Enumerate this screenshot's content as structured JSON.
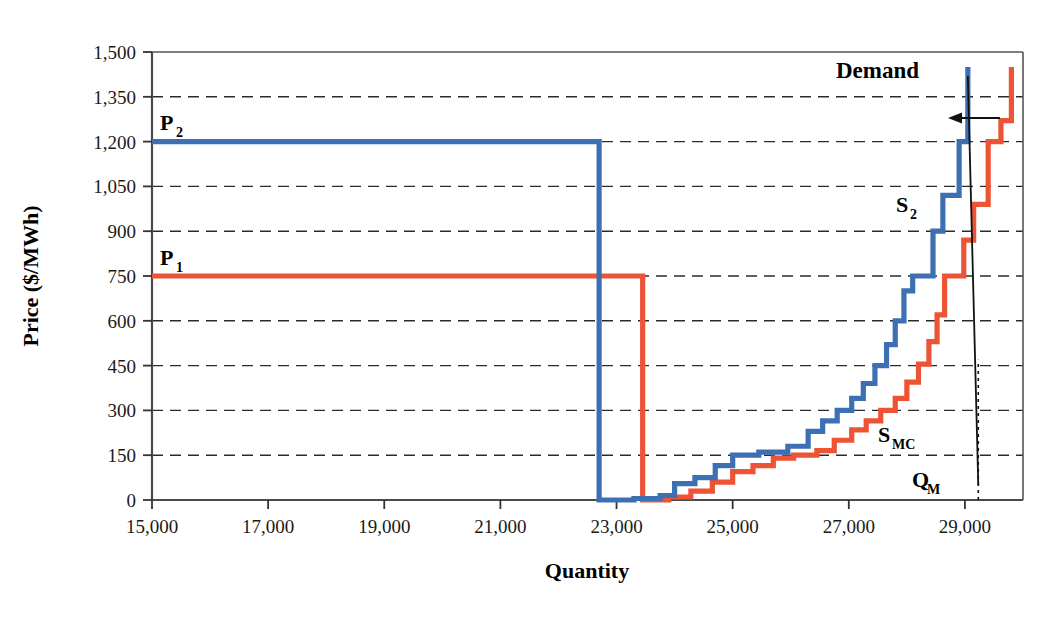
{
  "chart_data": {
    "type": "line",
    "title": "",
    "xlabel": "Quantity",
    "ylabel": "Price ($/MWh)",
    "xlim": [
      15000,
      30000
    ],
    "ylim": [
      0,
      1500
    ],
    "xticks": [
      "15,000",
      "17,000",
      "19,000",
      "21,000",
      "23,000",
      "25,000",
      "27,000",
      "29,000"
    ],
    "xtick_values": [
      15000,
      17000,
      19000,
      21000,
      23000,
      25000,
      27000,
      29000
    ],
    "yticks": [
      "0",
      "150",
      "300",
      "450",
      "600",
      "750",
      "900",
      "1,050",
      "1,200",
      "1,350",
      "1,500"
    ],
    "ytick_values": [
      0,
      150,
      300,
      450,
      600,
      750,
      900,
      1050,
      1200,
      1350,
      1500
    ],
    "grid": "horizontal-dashed",
    "legend": "inline-annotations",
    "colors": {
      "supply_s2": "#3d6fb3",
      "supply_smc": "#ed5335",
      "demand": "#000000",
      "grid": "#333333",
      "axis": "#4d4d4d"
    },
    "annotations": [
      {
        "name": "P2",
        "text": "P",
        "sub": "2",
        "x": 15300,
        "y": 1270,
        "note": "Price level of S2 offer curve plateau = 1200"
      },
      {
        "name": "P1",
        "text": "P",
        "sub": "1",
        "x": 15300,
        "y": 820,
        "note": "Price level of S_MC offer curve plateau = 750"
      },
      {
        "name": "Demand",
        "text": "Demand",
        "x": 28100,
        "y": 1455
      },
      {
        "name": "S2",
        "text": "S",
        "sub": "2",
        "x": 28000,
        "y": 985
      },
      {
        "name": "SMC",
        "text": "S",
        "sub": "MC",
        "x": 27900,
        "y": 215
      },
      {
        "name": "QM",
        "text": "Q",
        "sub": "M",
        "x": 28950,
        "y": 85
      },
      {
        "name": "shift-arrow",
        "text": "",
        "note": "leftward arrow from S_MC vertical segment to S2 vertical segment near P=1270"
      }
    ],
    "series": [
      {
        "name": "S_MC",
        "label": "S_MC",
        "color": "#ed5335",
        "description": "Marginal cost supply step curve; flat plateau at 750 from 15,000 to ~28,650 then steps upward sharply",
        "points": [
          [
            15000,
            750
          ],
          [
            23450,
            750
          ],
          [
            23450,
            0
          ],
          [
            23900,
            0
          ],
          [
            23900,
            10
          ],
          [
            24280,
            10
          ],
          [
            24280,
            30
          ],
          [
            24650,
            30
          ],
          [
            24650,
            60
          ],
          [
            25000,
            60
          ],
          [
            25000,
            95
          ],
          [
            25350,
            95
          ],
          [
            25350,
            115
          ],
          [
            25700,
            115
          ],
          [
            25700,
            140
          ],
          [
            26050,
            140
          ],
          [
            26050,
            150
          ],
          [
            26450,
            150
          ],
          [
            26450,
            165
          ],
          [
            26750,
            165
          ],
          [
            26750,
            200
          ],
          [
            27050,
            200
          ],
          [
            27050,
            235
          ],
          [
            27300,
            235
          ],
          [
            27300,
            265
          ],
          [
            27550,
            265
          ],
          [
            27550,
            300
          ],
          [
            27800,
            300
          ],
          [
            27800,
            340
          ],
          [
            28000,
            340
          ],
          [
            28000,
            395
          ],
          [
            28200,
            395
          ],
          [
            28200,
            455
          ],
          [
            28380,
            455
          ],
          [
            28380,
            530
          ],
          [
            28520,
            530
          ],
          [
            28520,
            620
          ],
          [
            28650,
            620
          ],
          [
            28650,
            750
          ],
          [
            28980,
            750
          ],
          [
            28980,
            870
          ],
          [
            29150,
            870
          ],
          [
            29150,
            990
          ],
          [
            29400,
            990
          ],
          [
            29400,
            1200
          ],
          [
            29620,
            1200
          ],
          [
            29620,
            1270
          ],
          [
            29800,
            1270
          ],
          [
            29800,
            1450
          ]
        ]
      },
      {
        "name": "S2",
        "label": "S2",
        "color": "#3d6fb3",
        "description": "Strategic/withheld supply step curve shifted left of S_MC; flat plateau at 1200 from 15,000 to ~29,050 then jumps vertically",
        "points": [
          [
            15000,
            1200
          ],
          [
            22700,
            1200
          ],
          [
            22700,
            0
          ],
          [
            23300,
            0
          ],
          [
            23300,
            5
          ],
          [
            23750,
            5
          ],
          [
            23750,
            15
          ],
          [
            24000,
            15
          ],
          [
            24000,
            55
          ],
          [
            24350,
            55
          ],
          [
            24350,
            75
          ],
          [
            24700,
            75
          ],
          [
            24700,
            115
          ],
          [
            25000,
            115
          ],
          [
            25000,
            150
          ],
          [
            25450,
            150
          ],
          [
            25450,
            160
          ],
          [
            25950,
            160
          ],
          [
            25950,
            180
          ],
          [
            26300,
            180
          ],
          [
            26300,
            230
          ],
          [
            26550,
            230
          ],
          [
            26550,
            265
          ],
          [
            26800,
            265
          ],
          [
            26800,
            300
          ],
          [
            27050,
            300
          ],
          [
            27050,
            340
          ],
          [
            27250,
            340
          ],
          [
            27250,
            390
          ],
          [
            27450,
            390
          ],
          [
            27450,
            450
          ],
          [
            27650,
            450
          ],
          [
            27650,
            520
          ],
          [
            27800,
            520
          ],
          [
            27800,
            600
          ],
          [
            27950,
            600
          ],
          [
            27950,
            700
          ],
          [
            28100,
            700
          ],
          [
            28100,
            750
          ],
          [
            28450,
            750
          ],
          [
            28450,
            900
          ],
          [
            28620,
            900
          ],
          [
            28620,
            1020
          ],
          [
            28900,
            1020
          ],
          [
            28900,
            1200
          ],
          [
            29050,
            1200
          ],
          [
            29050,
            1450
          ]
        ]
      },
      {
        "name": "Demand",
        "label": "Demand",
        "color": "#000000",
        "description": "Nearly vertical steeply downward sloping demand curve",
        "points": [
          [
            29050,
            1420
          ],
          [
            29230,
            50
          ]
        ]
      }
    ],
    "reference_lines": [
      {
        "name": "QM-dotted",
        "type": "vertical-dotted",
        "x": 29230,
        "y_from": 0,
        "y_to": 470
      }
    ]
  }
}
